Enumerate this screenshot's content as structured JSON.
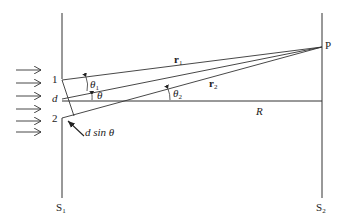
{
  "diagram": {
    "labels": {
      "slit1": "1",
      "slit2": "2",
      "separation": "d",
      "theta1": "θ",
      "theta1_sub": "1",
      "theta": "θ",
      "theta2": "θ",
      "theta2_sub": "2",
      "r1": "r",
      "r1_sub": "1",
      "r2": "r",
      "r2_sub": "2",
      "distance": "R",
      "point": "P",
      "path_diff": "d sin θ",
      "screen1": "S",
      "screen1_sub": "1",
      "screen2": "S",
      "screen2_sub": "2"
    },
    "incoming_arrows": 6,
    "colors": {
      "line": "#333333",
      "text": "#222222",
      "background": "#ffffff"
    }
  }
}
